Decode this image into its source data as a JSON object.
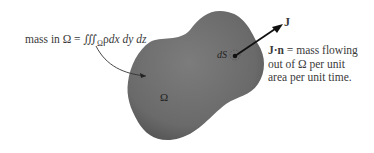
{
  "figure": {
    "type": "mass-flux diagram",
    "region_label": "Ω",
    "surface_element_label": "dS",
    "vector_label": "J",
    "mass_label": {
      "prefix": "mass in Ω = ∭",
      "subscript": "Ω",
      "integrand": "ρ",
      "differentials": "dx dy dz"
    },
    "flux_description": {
      "bold_term": "J·n",
      "line1_rest": " = mass flowing",
      "line2": "out of Ω per unit",
      "line3": "area per unit time."
    },
    "colors": {
      "region_fill": "#6f6f6f",
      "arrow": "#111111",
      "text": "#3a3a3a",
      "background": "#ffffff"
    }
  }
}
